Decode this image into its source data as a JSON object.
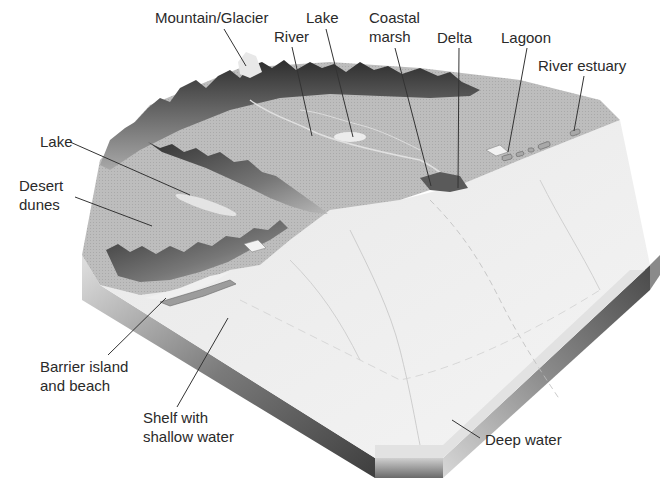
{
  "diagram": {
    "type": "block-diagram",
    "labels": [
      {
        "id": "mountain-glacier",
        "lines": [
          "Mountain/Glacier"
        ],
        "x": 155,
        "y": 8
      },
      {
        "id": "lake-top",
        "lines": [
          "Lake"
        ],
        "x": 306,
        "y": 8
      },
      {
        "id": "coastal-marsh",
        "lines": [
          "Coastal",
          "marsh"
        ],
        "x": 369,
        "y": 8
      },
      {
        "id": "river",
        "lines": [
          "River"
        ],
        "x": 274,
        "y": 27
      },
      {
        "id": "delta",
        "lines": [
          "Delta"
        ],
        "x": 437,
        "y": 28
      },
      {
        "id": "lagoon",
        "lines": [
          "Lagoon"
        ],
        "x": 501,
        "y": 28
      },
      {
        "id": "river-estuary",
        "lines": [
          "River estuary"
        ],
        "x": 538,
        "y": 56
      },
      {
        "id": "lake-left",
        "lines": [
          "Lake"
        ],
        "x": 40,
        "y": 132
      },
      {
        "id": "desert-dunes",
        "lines": [
          "Desert",
          "dunes"
        ],
        "x": 19,
        "y": 176
      },
      {
        "id": "barrier-island",
        "lines": [
          "Barrier island",
          "and beach"
        ],
        "x": 40,
        "y": 357
      },
      {
        "id": "shelf",
        "lines": [
          "Shelf with",
          "shallow water"
        ],
        "x": 143,
        "y": 408
      },
      {
        "id": "deep-water",
        "lines": [
          "Deep water"
        ],
        "x": 485,
        "y": 430
      }
    ],
    "leaders": [
      {
        "for": "mountain-glacier",
        "x1": 224,
        "y1": 29,
        "x2": 246,
        "y2": 66
      },
      {
        "for": "lake-top",
        "x1": 326,
        "y1": 29,
        "x2": 353,
        "y2": 137
      },
      {
        "for": "coastal-marsh",
        "x1": 395,
        "y1": 48,
        "x2": 431,
        "y2": 186
      },
      {
        "for": "river",
        "x1": 292,
        "y1": 47,
        "x2": 312,
        "y2": 136
      },
      {
        "for": "delta",
        "x1": 459,
        "y1": 48,
        "x2": 458,
        "y2": 188
      },
      {
        "for": "lagoon",
        "x1": 527,
        "y1": 48,
        "x2": 508,
        "y2": 152
      },
      {
        "for": "river-estuary",
        "x1": 584,
        "y1": 76,
        "x2": 574,
        "y2": 131
      },
      {
        "for": "lake-left",
        "x1": 70,
        "y1": 142,
        "x2": 190,
        "y2": 195
      },
      {
        "for": "desert-dunes",
        "x1": 75,
        "y1": 197,
        "x2": 152,
        "y2": 226
      },
      {
        "for": "barrier-island",
        "x1": 108,
        "y1": 355,
        "x2": 166,
        "y2": 298
      },
      {
        "for": "shelf",
        "x1": 177,
        "y1": 407,
        "x2": 228,
        "y2": 318
      },
      {
        "for": "deep-water",
        "x1": 480,
        "y1": 438,
        "x2": 452,
        "y2": 420
      }
    ],
    "colors": {
      "background": "#ffffff",
      "label_text": "#2a2a2a",
      "leader_line": "#333333",
      "land": "#bcbcbc",
      "mountain_dark": "#3a3a3a",
      "mountain_light": "#9a9a9a",
      "shallow_water": "#e6e6e6",
      "deep_water": "#f0f0f0",
      "edge_dark": "#555555",
      "edge_light": "#d8d8d8"
    }
  }
}
